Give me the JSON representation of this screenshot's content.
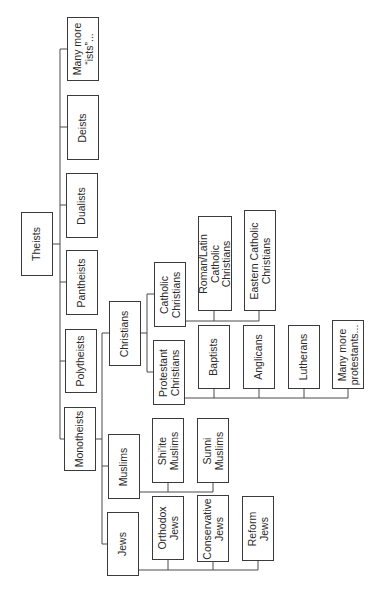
{
  "diagram": {
    "orientation": "rotated -90deg",
    "nodes": [
      {
        "id": "theists",
        "label": "Theists",
        "x": 21,
        "y": 212,
        "w": 32,
        "h": 64
      },
      {
        "id": "many_ists",
        "label": "Many more\n“ists”...",
        "x": 67,
        "y": 17,
        "w": 32,
        "h": 64
      },
      {
        "id": "deists",
        "label": "Deists",
        "x": 67,
        "y": 95,
        "w": 32,
        "h": 65
      },
      {
        "id": "dualists",
        "label": "Dualists",
        "x": 66,
        "y": 173,
        "w": 32,
        "h": 65
      },
      {
        "id": "pantheists",
        "label": "Pantheists",
        "x": 66,
        "y": 250,
        "w": 32,
        "h": 65
      },
      {
        "id": "polytheists",
        "label": "Polytheists",
        "x": 65,
        "y": 329,
        "w": 32,
        "h": 64
      },
      {
        "id": "monotheists",
        "label": "Monotheists",
        "x": 64,
        "y": 407,
        "w": 32,
        "h": 64
      },
      {
        "id": "christians",
        "label": "Christians",
        "x": 109,
        "y": 301,
        "w": 32,
        "h": 65
      },
      {
        "id": "muslims",
        "label": "Muslims",
        "x": 108,
        "y": 434,
        "w": 32,
        "h": 65
      },
      {
        "id": "jews",
        "label": "Jews",
        "x": 107,
        "y": 512,
        "w": 32,
        "h": 64
      },
      {
        "id": "catholic",
        "label": "Catholic\nChristians",
        "x": 154,
        "y": 262,
        "w": 32,
        "h": 65
      },
      {
        "id": "protestant",
        "label": "Protestant\nChristians",
        "x": 153,
        "y": 340,
        "w": 32,
        "h": 65
      },
      {
        "id": "roman_latin",
        "label": "Roman/Latin\nCatholic\nChristians",
        "x": 198,
        "y": 216,
        "w": 34,
        "h": 95
      },
      {
        "id": "eastern_catholic",
        "label": "Eastern Catholic\nChristians",
        "x": 244,
        "y": 210,
        "w": 32,
        "h": 101
      },
      {
        "id": "baptists",
        "label": "Baptists",
        "x": 198,
        "y": 325,
        "w": 32,
        "h": 64
      },
      {
        "id": "anglicans",
        "label": "Anglicans",
        "x": 243,
        "y": 325,
        "w": 32,
        "h": 64
      },
      {
        "id": "lutherans",
        "label": "Lutherans",
        "x": 288,
        "y": 325,
        "w": 32,
        "h": 64
      },
      {
        "id": "many_protestants",
        "label": "Many more\nprotestants...",
        "x": 332,
        "y": 320,
        "w": 32,
        "h": 69
      },
      {
        "id": "shiite",
        "label": "Shi'ite\nMuslims",
        "x": 152,
        "y": 418,
        "w": 32,
        "h": 65
      },
      {
        "id": "sunni",
        "label": "Sunni\nMuslims",
        "x": 197,
        "y": 418,
        "w": 32,
        "h": 65
      },
      {
        "id": "orthodox_jews",
        "label": "Orthodox\nJews",
        "x": 152,
        "y": 496,
        "w": 32,
        "h": 64
      },
      {
        "id": "conservative_jews",
        "label": "Conservative\nJews",
        "x": 197,
        "y": 495,
        "w": 32,
        "h": 67
      },
      {
        "id": "reform_jews",
        "label": "Reform\nJews",
        "x": 242,
        "y": 496,
        "w": 32,
        "h": 65
      }
    ],
    "connectors": [
      "M53 244 H60 M60 49 V439 M60 49 H67 M60 127 H67 M60 205 H66 M60 282 H66 M60 361 H65 M60 439 H64",
      "M96 439 H102 M102 333 V544 M102 333 H109 M102 466 H108 M102 544 H107",
      "M141 333 H147 M147 294 V372 M147 294 H154 M147 372 H153",
      "M186 321 H259 M214 311 V321 M259 311 V321",
      "M185 398 H348 M214 389 V398 M259 389 V398 M304 389 V398 M348 389 V398",
      "M140 492 H213 M168 483 V492 M213 483 V492",
      "M139 570 H258 M168 560 V570 M213 562 V570 M258 561 V570"
    ],
    "colors": {
      "stroke": "#3a3a3a",
      "text": "#2a2a2a",
      "background": "#ffffff"
    }
  }
}
